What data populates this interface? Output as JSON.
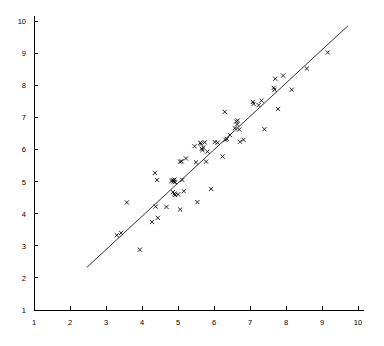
{
  "chart_data": {
    "type": "scatter",
    "title": "",
    "subtitle": "",
    "xlabel": "",
    "ylabel": "",
    "xlim": [
      1,
      10
    ],
    "ylim": [
      1,
      10
    ],
    "xticks": [
      1,
      2,
      3,
      4,
      5,
      6,
      7,
      8,
      9,
      10
    ],
    "yticks": [
      1,
      2,
      3,
      4,
      5,
      6,
      7,
      8,
      9,
      10
    ],
    "xtick_labels": [
      "1",
      "2",
      "3",
      "4",
      "5",
      "6",
      "7",
      "8",
      "9",
      "10"
    ],
    "ytick_labels": [
      "1",
      "2",
      "3",
      "4",
      "5",
      "6",
      "7",
      "8",
      "9",
      "10"
    ],
    "grid": false,
    "legend": null,
    "marker": "x",
    "marker_color": "#000000",
    "marker_size": 4.2,
    "series": [
      {
        "name": "observations",
        "marker": "x",
        "points": [
          [
            3.3,
            3.33
          ],
          [
            3.42,
            3.4
          ],
          [
            3.58,
            4.35
          ],
          [
            3.94,
            2.88
          ],
          [
            4.28,
            3.74
          ],
          [
            4.36,
            5.27
          ],
          [
            4.38,
            4.22
          ],
          [
            4.42,
            5.05
          ],
          [
            4.44,
            3.87
          ],
          [
            4.68,
            4.21
          ],
          [
            4.82,
            5.02
          ],
          [
            4.86,
            5.04
          ],
          [
            4.88,
            5.0
          ],
          [
            4.9,
            5.06
          ],
          [
            4.92,
            4.98
          ],
          [
            4.86,
            4.67
          ],
          [
            4.9,
            4.62
          ],
          [
            4.92,
            4.58
          ],
          [
            5.0,
            4.6
          ],
          [
            5.06,
            4.13
          ],
          [
            5.06,
            5.62
          ],
          [
            5.1,
            5.63
          ],
          [
            5.12,
            5.05
          ],
          [
            5.16,
            4.7
          ],
          [
            5.22,
            5.72
          ],
          [
            5.46,
            6.1
          ],
          [
            5.5,
            5.6
          ],
          [
            5.54,
            4.36
          ],
          [
            5.62,
            6.21
          ],
          [
            5.64,
            6.18
          ],
          [
            5.66,
            6.02
          ],
          [
            5.68,
            5.98
          ],
          [
            5.7,
            6.06
          ],
          [
            5.74,
            6.22
          ],
          [
            5.78,
            5.62
          ],
          [
            5.82,
            5.93
          ],
          [
            5.92,
            4.77
          ],
          [
            6.02,
            6.23
          ],
          [
            6.1,
            6.21
          ],
          [
            6.24,
            5.78
          ],
          [
            6.3,
            7.17
          ],
          [
            6.32,
            6.3
          ],
          [
            6.36,
            6.33
          ],
          [
            6.44,
            6.45
          ],
          [
            6.58,
            6.66
          ],
          [
            6.62,
            6.87
          ],
          [
            6.64,
            6.78
          ],
          [
            6.66,
            6.9
          ],
          [
            6.7,
            6.62
          ],
          [
            6.72,
            6.24
          ],
          [
            6.82,
            6.3
          ],
          [
            7.08,
            7.48
          ],
          [
            7.1,
            7.42
          ],
          [
            7.24,
            7.38
          ],
          [
            7.32,
            7.52
          ],
          [
            7.4,
            6.63
          ],
          [
            7.66,
            7.92
          ],
          [
            7.68,
            7.86
          ],
          [
            7.7,
            8.2
          ],
          [
            7.78,
            7.26
          ],
          [
            7.92,
            8.3
          ],
          [
            8.16,
            7.86
          ],
          [
            8.58,
            8.52
          ],
          [
            9.16,
            9.02
          ]
        ]
      }
    ],
    "fit_line": {
      "name": "regression-line",
      "x0": 2.47,
      "y0": 2.33,
      "x1": 9.72,
      "y1": 9.85,
      "color": "#1a1a1a"
    }
  },
  "axes": {
    "x_axis_name": "x-axis",
    "y_axis_name": "y-axis",
    "axis_color": "#000000"
  }
}
